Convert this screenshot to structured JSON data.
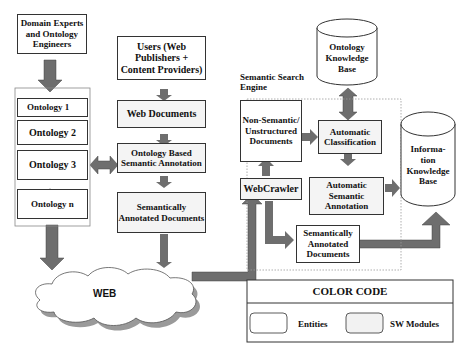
{
  "diagram": {
    "domain_experts": "Domain Experts and Ontology Engineers",
    "ontologies": [
      "Ontology 1",
      "Ontology 2",
      "Ontology 3",
      "Ontology n"
    ],
    "users": "Users (Web Publishers + Content Providers)",
    "web_documents": "Web Documents",
    "ontology_annotation": "Ontology Based Semantic Annotation",
    "semantically_annotated_docs_left": "Semantically Annotated Documents",
    "web": "WEB",
    "search_engine_label": "Semantic Search Engine",
    "non_semantic_docs": "Non-Semantic/ Unstructured Documents",
    "webcrawler": "WebCrawler",
    "automatic_classification": "Automatic Classification",
    "automatic_semantic_annotation": "Automatic Semantic Annotation",
    "semantically_annotated_docs_right": "Semantically Annotated Documents",
    "ontology_kb": "Ontology Knowledge Base",
    "information_kb": "Informa-tion Knowledge Base",
    "legend": {
      "title": "COLOR CODE",
      "entities": "Entities",
      "sw_modules": "SW Modules"
    },
    "colors": {
      "arrow": "#6e6e6e",
      "entity_fill": "#ffffff",
      "module_fill": "#f4f4f4"
    }
  }
}
